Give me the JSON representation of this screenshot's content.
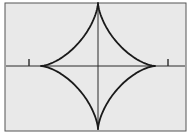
{
  "figure": {
    "caption": "",
    "background_color": "#ffffff"
  },
  "frame": {
    "name": "plot-frame",
    "fill_color": "#e9e9e9",
    "border_color": "#555555",
    "border_width": 1,
    "x": 5,
    "y": 3,
    "width": 181,
    "height": 128
  },
  "axes": {
    "color": "#2a2a2a",
    "line_width": 1,
    "origin": {
      "x": 98,
      "y": 66
    },
    "x_axis": {
      "x1": 6,
      "y1": 66,
      "x2": 185,
      "y2": 66,
      "label": ""
    },
    "y_axis": {
      "x1": 98,
      "y1": 4,
      "x2": 98,
      "y2": 130,
      "label": ""
    }
  },
  "ticks": {
    "color": "#2a2a2a",
    "marks": [
      {
        "name": "tick-left",
        "x": 29,
        "y_top": 59,
        "y_bottom": 66,
        "label": ""
      },
      {
        "name": "tick-right",
        "x": 168,
        "y_top": 59,
        "y_bottom": 66,
        "label": ""
      }
    ]
  },
  "chart_data": {
    "type": "line",
    "xlabel": "",
    "ylabel": "",
    "equation": "x^(2/3) + y^(2/3) = a^(2/3)",
    "parametric": "x = a cos^3(t),  y = a sin^3(t)",
    "grid": false,
    "legend": "none",
    "curve_color": "#1a1a1a",
    "curve_width": 1.8,
    "center_px": {
      "x": 98,
      "y": 66
    },
    "radius_x_px": 57,
    "radius_y_px": 63,
    "cusps_px": [
      {
        "name": "cusp-right",
        "x": 155,
        "y": 66
      },
      {
        "name": "cusp-top",
        "x": 98,
        "y": 3
      },
      {
        "name": "cusp-left",
        "x": 41,
        "y": 66
      },
      {
        "name": "cusp-bottom",
        "x": 98,
        "y": 129
      }
    ],
    "series": [
      {
        "name": "astroid",
        "x": [
          155,
          153.5,
          149.2,
          142.4,
          133.7,
          123.6,
          112.7,
          101.8,
          91.2,
          81.3,
          72.5,
          64.9,
          58.7,
          53.9,
          50.4,
          47.9,
          46.4,
          45.4,
          44.9,
          44.6,
          44.5,
          44.6,
          44.9,
          45.4,
          46.4,
          47.9,
          50.4,
          53.9,
          58.7,
          64.9,
          72.5,
          81.3,
          91.2,
          101.8,
          112.7,
          123.6,
          133.7,
          142.4,
          149.2,
          153.5,
          155
        ],
        "y": [
          66,
          64.2,
          59.1,
          51.4,
          42.0,
          32.0,
          22.5,
          14.2,
          7.7,
          3.3,
          0.9,
          0.1,
          0.0,
          0.6,
          2.8,
          6.9,
          13.0,
          21.1,
          30.9,
          42.0,
          53.7,
          65.4,
          76.5,
          86.3,
          94.4,
          100.5,
          104.6,
          106.8,
          107.4,
          106.9,
          105.5,
          103.1,
          99.6,
          94.9,
          88.9,
          81.5,
          72.8,
          63.0,
          52.5,
          41.6,
          30.6
        ],
        "note": "rendered via SVG path; cubic approximation of a x=a cos^3 t, y=a sin^3 t astroid"
      }
    ]
  }
}
